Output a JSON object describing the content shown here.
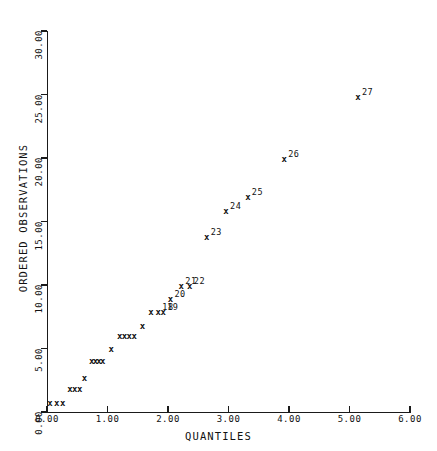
{
  "chart_data": {
    "type": "scatter",
    "title": "",
    "xlabel": "QUANTILES",
    "ylabel": "ORDERED OBSERVATIONS",
    "xlim": [
      0.0,
      6.0
    ],
    "ylim": [
      0.0,
      30.0
    ],
    "xticks": [
      "0.00",
      "1.00",
      "2.00",
      "3.00",
      "4.00",
      "5.00",
      "6.00"
    ],
    "xtick_values": [
      0.0,
      1.0,
      2.0,
      3.0,
      4.0,
      5.0,
      6.0
    ],
    "yticks": [
      "0.00",
      "5.00",
      "10.00",
      "15.00",
      "20.00",
      "25.00",
      "30.00"
    ],
    "ytick_values": [
      0.0,
      5.0,
      10.0,
      15.0,
      20.0,
      25.0,
      30.0
    ],
    "grid": false,
    "legend": "none",
    "marker": "x",
    "points": [
      {
        "x": 0.05,
        "y": 0.7,
        "label": ""
      },
      {
        "x": 0.16,
        "y": 0.7,
        "label": ""
      },
      {
        "x": 0.26,
        "y": 0.7,
        "label": ""
      },
      {
        "x": 0.38,
        "y": 1.8,
        "label": ""
      },
      {
        "x": 0.46,
        "y": 1.8,
        "label": ""
      },
      {
        "x": 0.54,
        "y": 1.8,
        "label": ""
      },
      {
        "x": 0.62,
        "y": 2.7,
        "label": ""
      },
      {
        "x": 0.74,
        "y": 4.0,
        "label": ""
      },
      {
        "x": 0.8,
        "y": 4.0,
        "label": ""
      },
      {
        "x": 0.86,
        "y": 4.0,
        "label": ""
      },
      {
        "x": 0.92,
        "y": 4.0,
        "label": ""
      },
      {
        "x": 1.06,
        "y": 5.0,
        "label": ""
      },
      {
        "x": 1.2,
        "y": 6.0,
        "label": ""
      },
      {
        "x": 1.28,
        "y": 6.0,
        "label": ""
      },
      {
        "x": 1.36,
        "y": 6.0,
        "label": ""
      },
      {
        "x": 1.44,
        "y": 6.0,
        "label": ""
      },
      {
        "x": 1.58,
        "y": 6.8,
        "label": ""
      },
      {
        "x": 1.72,
        "y": 7.9,
        "label": ""
      },
      {
        "x": 1.84,
        "y": 7.9,
        "label": "18"
      },
      {
        "x": 1.92,
        "y": 7.9,
        "label": "19"
      },
      {
        "x": 2.04,
        "y": 8.9,
        "label": "20"
      },
      {
        "x": 2.22,
        "y": 9.9,
        "label": "21"
      },
      {
        "x": 2.36,
        "y": 9.9,
        "label": "22"
      },
      {
        "x": 2.64,
        "y": 13.8,
        "label": "23"
      },
      {
        "x": 2.96,
        "y": 15.8,
        "label": "24"
      },
      {
        "x": 3.32,
        "y": 16.9,
        "label": "25"
      },
      {
        "x": 3.92,
        "y": 19.9,
        "label": "26"
      },
      {
        "x": 5.14,
        "y": 24.8,
        "label": "27"
      }
    ]
  }
}
